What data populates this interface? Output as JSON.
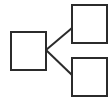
{
  "diagram": {
    "type": "tree",
    "colors": {
      "background": "#ffffff",
      "stroke": "#2b2b2b"
    },
    "nodes": [
      {
        "id": "parent",
        "x": 11,
        "y": 32,
        "w": 35,
        "h": 38
      },
      {
        "id": "child-top",
        "x": 72,
        "y": 5,
        "w": 35,
        "h": 38
      },
      {
        "id": "child-bottom",
        "x": 72,
        "y": 58,
        "w": 35,
        "h": 38
      }
    ],
    "edges": [
      {
        "from": "parent",
        "to": "child-top",
        "x1": 46,
        "y1": 50,
        "x2": 72,
        "y2": 28
      },
      {
        "from": "parent",
        "to": "child-bottom",
        "x1": 46,
        "y1": 50,
        "x2": 72,
        "y2": 75
      }
    ]
  }
}
